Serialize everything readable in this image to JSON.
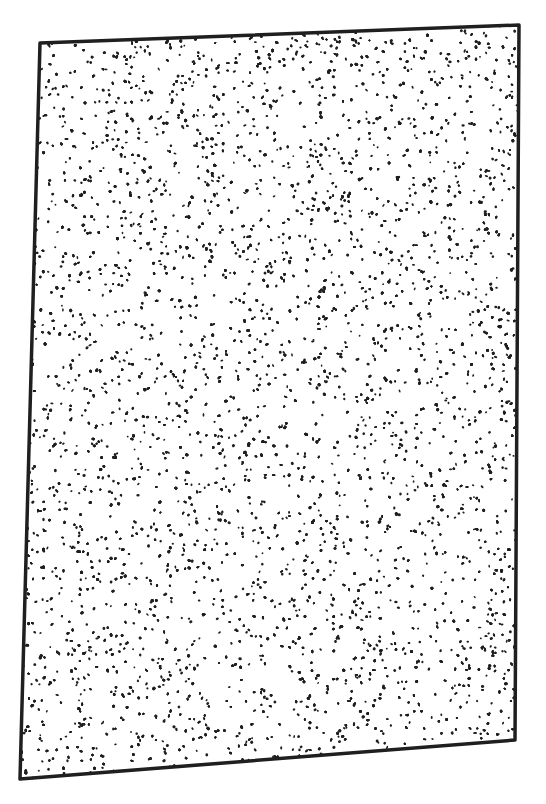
{
  "artwork": {
    "subject": "hand-drawn stippled rectangle",
    "technique": "stippling",
    "ink_color": "#1f1f1f",
    "background_color": "#ffffff",
    "dot_density": "dense, fairly uniform"
  }
}
